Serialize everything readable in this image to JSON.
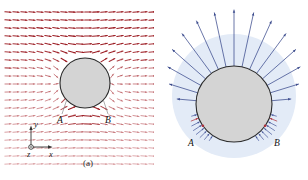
{
  "figure": {
    "panels": [
      {
        "id": "a",
        "caption": "(a)",
        "point_labels": [
          "A",
          "B"
        ],
        "axes": {
          "x": "x",
          "y": "y",
          "z": "z"
        },
        "cylinder": {
          "cx": 85,
          "cy": 83,
          "r": 25,
          "fill": "#d4d4d4",
          "stroke": "#2b2b2b"
        },
        "field": {
          "type": "vector-arrow-grid",
          "color_strong": "#9b1b22",
          "color_weak": "#e8b9bc",
          "grid_spacing_x": 8,
          "grid_spacing_y": 8,
          "description": "uniform-flow-past-cylinder"
        }
      },
      {
        "id": "b",
        "caption": "(b)",
        "point_labels": [
          "A",
          "B"
        ],
        "cylinder": {
          "cx": 234,
          "cy": 104,
          "r": 38,
          "fill": "#d4d4d4",
          "stroke": "#2b2b2b"
        },
        "halo": {
          "cx": 234,
          "cy": 96,
          "r": 62,
          "fill": "#e3ebf7"
        },
        "field": {
          "type": "radial-surface-arrows",
          "color_outward": "#3a4a8c",
          "color_inward": "#4a5a9c",
          "color_accent": "#b0303a",
          "description": "pressure-distribution-on-cylinder"
        }
      }
    ]
  },
  "chart_data": {
    "type": "scatter",
    "title": "",
    "xlabel": "x",
    "ylabel": "y",
    "series": [
      {
        "name": "panel-a-vector-field",
        "description": "Arrow grid of velocity vectors for potential flow past a circular cylinder; arrows are horizontal far from the body, deflect and intensify (dark red) above the cylinder, and fade (light pink) in the lower wake region.",
        "grid_cols": 19,
        "grid_rows": 20,
        "arrow_spacing": [
          8,
          8
        ],
        "obstacle": {
          "cx": 85,
          "cy": 83,
          "r": 25
        },
        "stagnation_points": [
          "A",
          "B"
        ]
      },
      {
        "name": "panel-b-surface-arrows",
        "description": "Radial arrows normal to the cylinder surface: long outward arrows over the upper half pointing away from the body, short inward arrows clustered near A and B on the lower half.",
        "outward_arrow_count": 15,
        "outward_arc_degrees": [
          -175,
          -5
        ],
        "inward_arrow_clusters": 2,
        "inward_arrows_per_cluster": 8,
        "obstacle": {
          "cx": 234,
          "cy": 104,
          "r": 38
        },
        "marked_points": [
          "A",
          "B"
        ]
      }
    ]
  }
}
